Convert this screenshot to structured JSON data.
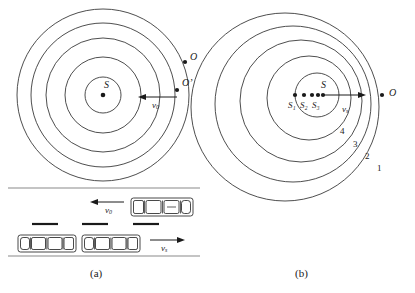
{
  "figure": {
    "type": "doppler-effect-wavefront-diagram",
    "stroke_color": "#3a3a3a",
    "text_color": "#1a1a1a"
  },
  "panel_a": {
    "caption": "(a)",
    "description": "Stationary source S emitting concentric circular wavefronts; observer O moving toward the source with velocity v0",
    "source_label": "S",
    "observer_label": "O",
    "observer_prime_label": "O’",
    "velocity_label": "v",
    "velocity_subscript": "0",
    "wavefront_count": 5,
    "wavefront_radii": [
      18,
      38,
      57,
      72,
      86
    ],
    "center": {
      "x": 103,
      "y": 95
    },
    "arrow": {
      "direction": "left",
      "from_x": 176,
      "to_x": 140,
      "y": 97
    },
    "road_scene": {
      "top_road_line_y": 188,
      "bottom_road_line_y": 256,
      "upper_car": {
        "label": "v",
        "subscript": "0",
        "direction": "left",
        "count": 1
      },
      "lower_cars": {
        "label": "v",
        "subscript": "s",
        "direction": "right",
        "count": 2
      },
      "lane_dashes": 3
    }
  },
  "panel_b": {
    "caption": "(b)",
    "description": "Source S moving to the right with velocity vs; wavefronts bunch up ahead of the source. Past source positions S1, S2, S3 shown as dots.",
    "source_label": "S",
    "observer_label": "O",
    "velocity_label": "v",
    "velocity_subscript": "s",
    "past_source_labels": [
      "S₁",
      "S₂",
      "S₃"
    ],
    "past_source_names": [
      "S1",
      "S2",
      "S3"
    ],
    "source_dot_count": 5,
    "wavefront_numbers": [
      "1",
      "2",
      "3",
      "4"
    ],
    "wavefront_count": 5,
    "arrow": {
      "direction": "right",
      "from_x": 118,
      "to_x": 160,
      "y": 97
    }
  }
}
